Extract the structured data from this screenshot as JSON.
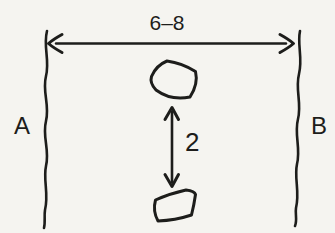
{
  "figure": {
    "type": "hand-drawn-diagram",
    "background_color": "#f5f4f0",
    "ink_color": "#1d1d1b",
    "labels": {
      "width_dimension": "6–8",
      "left_boundary": "A",
      "right_boundary": "B",
      "gap_dimension": "2"
    },
    "elements": [
      "left-wavy-boundary",
      "right-wavy-boundary",
      "horizontal-double-arrow",
      "vertical-double-arrow",
      "upper-stone-shape",
      "lower-stone-shape"
    ]
  }
}
